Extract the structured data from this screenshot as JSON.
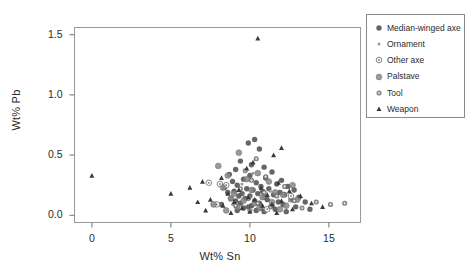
{
  "chart_data": {
    "type": "scatter",
    "title": "",
    "xlabel": "Wt% Sn",
    "ylabel": "Wt% Pb",
    "xlim": [
      -1.1,
      17.0
    ],
    "ylim": [
      -0.06,
      1.56
    ],
    "xticks": [
      0,
      5,
      10,
      15
    ],
    "xtick_labels": [
      "0",
      "5",
      "10",
      "15"
    ],
    "yticks": [
      0.0,
      0.5,
      1.0,
      1.5
    ],
    "ytick_labels": [
      "0.0",
      "0.5",
      "1.0",
      "1.5"
    ],
    "grid": false,
    "legend_position": "right-outside",
    "series": [
      {
        "name": "Median-winged axe",
        "marker": "filled-circle",
        "color": "#555555",
        "points": [
          [
            9.9,
            0.6
          ],
          [
            10.3,
            0.63
          ],
          [
            10.6,
            0.55
          ],
          [
            9.4,
            0.45
          ],
          [
            10.1,
            0.42
          ],
          [
            10.9,
            0.4
          ],
          [
            9.1,
            0.38
          ],
          [
            11.4,
            0.36
          ],
          [
            8.7,
            0.34
          ],
          [
            10.0,
            0.33
          ],
          [
            11.0,
            0.31
          ],
          [
            9.6,
            0.3
          ],
          [
            12.0,
            0.29
          ],
          [
            8.9,
            0.28
          ],
          [
            10.4,
            0.27
          ],
          [
            11.7,
            0.26
          ],
          [
            9.2,
            0.25
          ],
          [
            10.7,
            0.24
          ],
          [
            12.4,
            0.24
          ],
          [
            8.4,
            0.23
          ],
          [
            9.8,
            0.22
          ],
          [
            11.2,
            0.22
          ],
          [
            10.2,
            0.21
          ],
          [
            12.8,
            0.21
          ],
          [
            9.0,
            0.2
          ],
          [
            10.8,
            0.2
          ],
          [
            11.9,
            0.19
          ],
          [
            8.6,
            0.19
          ],
          [
            9.5,
            0.18
          ],
          [
            10.5,
            0.18
          ],
          [
            11.5,
            0.17
          ],
          [
            12.2,
            0.17
          ],
          [
            9.3,
            0.16
          ],
          [
            10.0,
            0.16
          ],
          [
            10.9,
            0.15
          ],
          [
            13.1,
            0.15
          ],
          [
            8.8,
            0.14
          ],
          [
            9.7,
            0.14
          ],
          [
            11.1,
            0.13
          ],
          [
            12.6,
            0.13
          ],
          [
            10.3,
            0.12
          ],
          [
            9.1,
            0.12
          ],
          [
            11.8,
            0.11
          ],
          [
            13.5,
            0.11
          ],
          [
            10.6,
            0.1
          ],
          [
            9.4,
            0.1
          ],
          [
            12.1,
            0.09
          ],
          [
            8.2,
            0.09
          ],
          [
            10.1,
            0.08
          ],
          [
            11.4,
            0.08
          ],
          [
            9.9,
            0.07
          ],
          [
            12.9,
            0.07
          ],
          [
            10.7,
            0.06
          ],
          [
            9.6,
            0.06
          ],
          [
            11.6,
            0.05
          ],
          [
            13.8,
            0.05
          ],
          [
            10.4,
            0.04
          ],
          [
            9.2,
            0.04
          ],
          [
            12.3,
            0.03
          ],
          [
            10.9,
            0.03
          ]
        ]
      },
      {
        "name": "Ornament",
        "marker": "small-dot",
        "color": "#9a9a9a",
        "points": [
          [
            10.2,
            0.35
          ],
          [
            9.5,
            0.26
          ],
          [
            11.3,
            0.2
          ],
          [
            10.0,
            0.15
          ],
          [
            12.5,
            0.12
          ],
          [
            8.9,
            0.09
          ],
          [
            10.7,
            0.06
          ]
        ]
      },
      {
        "name": "Other axe",
        "marker": "open-circle",
        "color": "#777777",
        "points": [
          [
            7.4,
            0.27
          ],
          [
            8.1,
            0.26
          ],
          [
            8.5,
            0.25
          ],
          [
            12.6,
            0.16
          ],
          [
            7.9,
            0.09
          ],
          [
            11.1,
            0.05
          ]
        ]
      },
      {
        "name": "Palstave",
        "marker": "shaded-circle",
        "color": "#8c8c8c",
        "points": [
          [
            9.3,
            0.52
          ],
          [
            8.0,
            0.41
          ],
          [
            10.5,
            0.35
          ],
          [
            8.6,
            0.33
          ],
          [
            9.8,
            0.3
          ],
          [
            11.2,
            0.28
          ],
          [
            12.7,
            0.25
          ],
          [
            8.3,
            0.23
          ],
          [
            10.1,
            0.21
          ],
          [
            11.6,
            0.19
          ],
          [
            9.0,
            0.18
          ],
          [
            12.1,
            0.17
          ],
          [
            10.8,
            0.15
          ],
          [
            8.8,
            0.14
          ],
          [
            13.0,
            0.13
          ],
          [
            9.6,
            0.12
          ],
          [
            11.4,
            0.11
          ],
          [
            10.3,
            0.1
          ],
          [
            7.7,
            0.09
          ],
          [
            12.3,
            0.08
          ],
          [
            9.2,
            0.07
          ],
          [
            10.6,
            0.06
          ],
          [
            11.9,
            0.05
          ],
          [
            8.5,
            0.04
          ]
        ]
      },
      {
        "name": "Tool",
        "marker": "plus-circle",
        "color": "#6b6b6b",
        "points": [
          [
            10.4,
            0.47
          ],
          [
            9.7,
            0.37
          ],
          [
            11.0,
            0.32
          ],
          [
            10.1,
            0.29
          ],
          [
            12.2,
            0.24
          ],
          [
            9.4,
            0.22
          ],
          [
            10.9,
            0.19
          ],
          [
            11.7,
            0.16
          ],
          [
            9.9,
            0.14
          ],
          [
            12.8,
            0.12
          ],
          [
            10.5,
            0.1
          ],
          [
            9.1,
            0.08
          ],
          [
            11.3,
            0.07
          ],
          [
            13.3,
            0.06
          ],
          [
            10.0,
            0.04
          ],
          [
            14.2,
            0.11
          ],
          [
            15.1,
            0.09
          ],
          [
            16.0,
            0.1
          ]
        ]
      },
      {
        "name": "Weapon",
        "marker": "triangle",
        "color": "#3a3a3a",
        "points": [
          [
            10.5,
            1.47
          ],
          [
            0.0,
            0.33
          ],
          [
            12.0,
            0.56
          ],
          [
            11.5,
            0.5
          ],
          [
            10.2,
            0.44
          ],
          [
            9.8,
            0.39
          ],
          [
            8.2,
            0.31
          ],
          [
            7.0,
            0.28
          ],
          [
            11.8,
            0.27
          ],
          [
            6.2,
            0.23
          ],
          [
            10.7,
            0.23
          ],
          [
            9.3,
            0.21
          ],
          [
            12.5,
            0.2
          ],
          [
            5.0,
            0.18
          ],
          [
            8.6,
            0.18
          ],
          [
            11.1,
            0.17
          ],
          [
            13.2,
            0.16
          ],
          [
            9.9,
            0.15
          ],
          [
            7.5,
            0.13
          ],
          [
            10.3,
            0.13
          ],
          [
            12.0,
            0.12
          ],
          [
            6.7,
            0.11
          ],
          [
            9.0,
            0.11
          ],
          [
            13.9,
            0.1
          ],
          [
            11.4,
            0.09
          ],
          [
            8.3,
            0.08
          ],
          [
            10.8,
            0.08
          ],
          [
            14.6,
            0.07
          ],
          [
            9.5,
            0.06
          ],
          [
            12.7,
            0.05
          ],
          [
            7.2,
            0.04
          ],
          [
            10.0,
            0.03
          ],
          [
            11.7,
            0.02
          ],
          [
            8.8,
            0.02
          ]
        ]
      }
    ]
  }
}
